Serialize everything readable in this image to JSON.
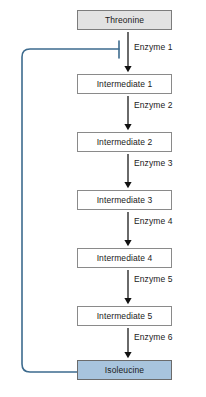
{
  "diagram": {
    "colors": {
      "substrate_fill": "#e2e2e2",
      "intermediate_fill": "#ffffff",
      "product_fill": "#a8c4dd",
      "box_border": "#818181",
      "arrow": "#111111",
      "feedback_line": "#3d6b8e",
      "background": "#ffffff"
    },
    "nodes": [
      {
        "id": "threonine",
        "label": "Threonine",
        "kind": "substrate",
        "y": 10
      },
      {
        "id": "intermediate-1",
        "label": "Intermediate 1",
        "kind": "intermediate",
        "y": 74
      },
      {
        "id": "intermediate-2",
        "label": "Intermediate 2",
        "kind": "intermediate",
        "y": 132
      },
      {
        "id": "intermediate-3",
        "label": "Intermediate 3",
        "kind": "intermediate",
        "y": 190
      },
      {
        "id": "intermediate-4",
        "label": "Intermediate 4",
        "kind": "intermediate",
        "y": 248
      },
      {
        "id": "intermediate-5",
        "label": "Intermediate 5",
        "kind": "intermediate",
        "y": 306
      },
      {
        "id": "isoleucine",
        "label": "Isoleucine",
        "kind": "product",
        "y": 360
      }
    ],
    "steps": [
      {
        "id": "enzyme-1",
        "label": "Enzyme 1",
        "label_y": 44,
        "arrow_top": 32,
        "arrow_bottom": 72
      },
      {
        "id": "enzyme-2",
        "label": "Enzyme 2",
        "label_y": 102,
        "arrow_top": 96,
        "arrow_bottom": 130
      },
      {
        "id": "enzyme-3",
        "label": "Enzyme 3",
        "label_y": 160,
        "arrow_top": 154,
        "arrow_bottom": 188
      },
      {
        "id": "enzyme-4",
        "label": "Enzyme 4",
        "label_y": 218,
        "arrow_top": 212,
        "arrow_bottom": 246
      },
      {
        "id": "enzyme-5",
        "label": "Enzyme 5",
        "label_y": 276,
        "arrow_top": 270,
        "arrow_bottom": 304
      },
      {
        "id": "enzyme-6",
        "label": "Enzyme 6",
        "label_y": 334,
        "arrow_top": 328,
        "arrow_bottom": 358
      }
    ],
    "feedback": {
      "id": "feedback-inhibition-loop",
      "from_node": "isoleucine",
      "to_step": "enzyme-1",
      "relation": "inhibition",
      "path": "M 77 372 L 30 372 Q 22 372 22 364 L 22 57 Q 22 49 30 49 L 119 49",
      "inhibition_bar": {
        "x": 119,
        "y_top": 41,
        "y_bottom": 58
      }
    }
  }
}
